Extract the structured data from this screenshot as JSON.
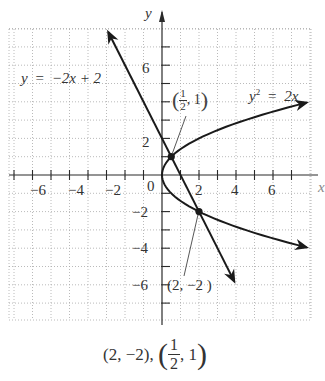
{
  "chart_data": {
    "type": "line",
    "title": "",
    "xlabel": "x",
    "ylabel": "y",
    "xlim": [
      -8.3,
      8
    ],
    "ylim": [
      -7.9,
      8
    ],
    "grid": true,
    "grid_style": "dotted",
    "x_ticks": [
      -6,
      -4,
      -2,
      2,
      4,
      6
    ],
    "y_ticks": [
      -6,
      -4,
      -2,
      2,
      6
    ],
    "origin_label": "0",
    "series": [
      {
        "name": "y = −2x + 2",
        "kind": "line",
        "equation": "y = -2x + 2",
        "x": [
          -2.9,
          3.9
        ],
        "y": [
          7.8,
          -5.8
        ],
        "arrows": "both"
      },
      {
        "name": "y² = 2x",
        "kind": "parabola",
        "equation": "y^2 = 2x",
        "x": [
          0,
          0.125,
          0.5,
          1.125,
          2,
          3.125,
          4.5,
          6.125,
          7.8
        ],
        "y_upper": [
          0,
          0.5,
          1,
          1.5,
          2,
          2.5,
          3,
          3.5,
          3.95
        ],
        "y_lower": [
          0,
          -0.5,
          -1,
          -1.5,
          -2,
          -2.5,
          -3,
          -3.5,
          -3.95
        ],
        "arrows": "both"
      }
    ],
    "points": [
      {
        "x": 0.5,
        "y": 1,
        "label": "(1/2, 1)"
      },
      {
        "x": 2,
        "y": -2,
        "label": "(2, −2)"
      }
    ],
    "annotations": [
      {
        "text": "y = −2x + 2",
        "near": "upper-left line"
      },
      {
        "text": "y² = 2x",
        "near": "upper-right parabola"
      },
      {
        "text": "(1/2, 1)",
        "near": "intersection point 1"
      },
      {
        "text": "(2, −2)",
        "near": "intersection point 2"
      }
    ]
  },
  "labels": {
    "y_axis": "y",
    "x_axis": "x",
    "origin": "0",
    "x_tick_labels": [
      "−6",
      "−4",
      "−2",
      "2",
      "4",
      "6"
    ],
    "y_tick_labels": [
      "6",
      "2",
      "−2",
      "−4",
      "−6"
    ],
    "line_eq": {
      "lhs": "y",
      "eq": "=",
      "rhs": "−2x + 2"
    },
    "parabola_eq": {
      "lhs": "y",
      "sup": "2",
      "eq": "=",
      "rhs": "2x"
    },
    "point1": {
      "num": "1",
      "den": "2",
      "y": ", 1"
    },
    "point2": "(2, −2 )"
  },
  "answer": {
    "first": "(2, −2),",
    "frac_num": "1",
    "frac_den": "2",
    "second_y": ", 1"
  },
  "colors": {
    "curve": "#1a1a1a",
    "axis": "#2a2a2a",
    "grid": "#a8a8a8",
    "text": "#333333"
  }
}
